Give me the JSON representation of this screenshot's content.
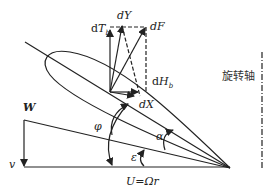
{
  "diagram": {
    "type": "blade-element force and velocity diagram",
    "labels": {
      "dT": {
        "d": "d",
        "main": "T",
        "sub": "b"
      },
      "dY": "dY",
      "dF": "dF",
      "dH": {
        "d": "d",
        "main": "H",
        "sub": "b"
      },
      "dX": "dX",
      "W": "W",
      "v": "v",
      "phi": "φ",
      "alpha": "α",
      "epsilon": "ε",
      "U": "U=Ωr",
      "axis": "旋转轴"
    },
    "colors": {
      "stroke": "#222222",
      "background": "#ffffff"
    }
  }
}
